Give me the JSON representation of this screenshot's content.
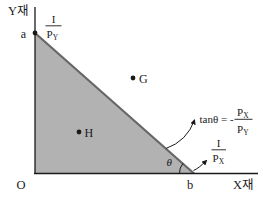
{
  "colors": {
    "background": "#ffffff",
    "triangle_fill": "#b2b2b2",
    "hypotenuse": "#666666",
    "axis": "#1a1a1a",
    "text": "#1a1a1a"
  },
  "axes": {
    "y_axis_label": "Y재",
    "x_axis_label": "X재",
    "origin_label": "O"
  },
  "points": {
    "a_label": "a",
    "b_label": "b",
    "g_label": "G",
    "h_label": "H"
  },
  "y_intercept_fraction": {
    "numerator": "I",
    "denominator_base": "P",
    "denominator_sub": "Y"
  },
  "x_intercept_fraction": {
    "numerator": "I",
    "denominator_base": "P",
    "denominator_sub": "X"
  },
  "angle": {
    "label": "θ"
  },
  "slope_formula": {
    "lhs": "tanθ = -",
    "numerator_base": "P",
    "numerator_sub": "X",
    "denominator_base": "P",
    "denominator_sub": "Y"
  }
}
